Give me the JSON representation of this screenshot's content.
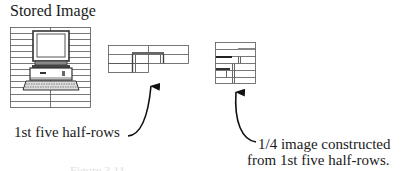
{
  "diagram": {
    "title": "Stored Image",
    "labels": {
      "half_rows": "1st five half-rows",
      "quarter_line1": "1/4 image constructed",
      "quarter_line2": "from 1st five half-rows."
    },
    "caption": "Figure 3.11",
    "panels": [
      {
        "name": "stored-image",
        "rows": 13,
        "cols": 2
      },
      {
        "name": "half-rows-image",
        "rows": 3,
        "cols": 2
      },
      {
        "name": "quarter-image",
        "rows": 6,
        "cols": 1
      }
    ],
    "colors": {
      "line": "#444444",
      "dark": "#222222",
      "gray": "#888888"
    }
  }
}
